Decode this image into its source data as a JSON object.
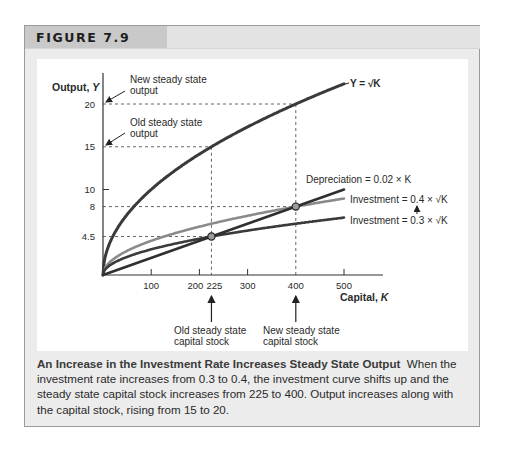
{
  "figure": {
    "label": "FIGURE 7.9",
    "caption_title": "An Increase in the Investment Rate Increases Steady State Output",
    "caption_body": "When the investment rate increases from 0.3 to 0.4, the investment curve shifts up and the steady state capital stock increases from 225 to 400. Output increases along with the capital stock, rising from 15 to 20."
  },
  "annotations": {
    "new_output": [
      "New steady state",
      "output"
    ],
    "old_output": [
      "Old steady state",
      "output"
    ],
    "old_capital": [
      "Old steady state",
      "capital stock"
    ],
    "new_capital": [
      "New steady state",
      "capital stock"
    ]
  },
  "colors": {
    "output_curve": "#3a3a3a",
    "depreciation": "#2f2f2f",
    "investment_new": "#8a8a8a",
    "investment_old": "#3a3a3a",
    "marker_fill": "#9a9a9a",
    "guide": "#555555"
  },
  "chart_data": {
    "type": "line",
    "title": "FIGURE 7.9",
    "xlabel": "Capital, K",
    "ylabel": "Output, Y",
    "xlim": [
      0,
      500
    ],
    "ylim": [
      0,
      22
    ],
    "x_ticks": [
      100,
      200,
      225,
      300,
      400,
      500
    ],
    "y_ticks": [
      4.5,
      8,
      10,
      15,
      20
    ],
    "grid": false,
    "series": [
      {
        "name": "Y = √K",
        "function": "sqrt(K)",
        "x": [
          0,
          100,
          225,
          400,
          500
        ],
        "values": [
          0,
          10,
          15,
          20,
          22.36
        ]
      },
      {
        "name": "Depreciation = 0.02 × K",
        "function": "0.02*K",
        "x": [
          0,
          225,
          400,
          500
        ],
        "values": [
          0,
          4.5,
          8,
          10
        ]
      },
      {
        "name": "Investment = 0.4 × √K",
        "function": "0.4*sqrt(K)",
        "x": [
          0,
          225,
          400,
          500
        ],
        "values": [
          0,
          6,
          8,
          8.94
        ]
      },
      {
        "name": "Investment = 0.3 × √K",
        "function": "0.3*sqrt(K)",
        "x": [
          0,
          225,
          400,
          500
        ],
        "values": [
          0,
          4.5,
          6,
          6.71
        ]
      }
    ],
    "steady_states": [
      {
        "label": "Old steady state",
        "K": 225,
        "investment": 4.5,
        "Y": 15
      },
      {
        "label": "New steady state",
        "K": 400,
        "investment": 8,
        "Y": 20
      }
    ],
    "legend": {
      "y_label": "Y = √K",
      "dep_label": "Depreciation = 0.02 × K",
      "inv_new_label": "Investment = 0.4 × √K",
      "inv_old_label": "Investment = 0.3 × √K"
    }
  }
}
